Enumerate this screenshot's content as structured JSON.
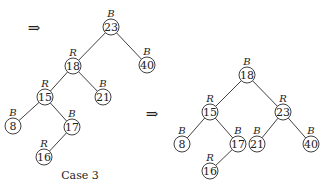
{
  "arrows": [
    {
      "symbol": "⇒",
      "x": 34,
      "y": 33
    },
    {
      "symbol": "⇒",
      "x": 152,
      "y": 119
    }
  ],
  "caption": {
    "text": "Case 3",
    "x": 80,
    "y": 179
  },
  "trees": [
    {
      "name": "before",
      "nodes": [
        {
          "id": "23",
          "value": "23",
          "color": "B",
          "x": 111,
          "y": 27
        },
        {
          "id": "18",
          "value": "18",
          "color": "R",
          "x": 73,
          "y": 66
        },
        {
          "id": "40",
          "value": "40",
          "color": "B",
          "x": 147,
          "y": 65
        },
        {
          "id": "15",
          "value": "15",
          "color": "R",
          "x": 45,
          "y": 97
        },
        {
          "id": "21",
          "value": "21",
          "color": "B",
          "x": 103,
          "y": 97
        },
        {
          "id": "8",
          "value": "8",
          "color": "B",
          "x": 13,
          "y": 126
        },
        {
          "id": "17",
          "value": "17",
          "color": "B",
          "x": 72,
          "y": 127
        },
        {
          "id": "16",
          "value": "16",
          "color": "R",
          "x": 44,
          "y": 157
        }
      ],
      "edges": [
        [
          "23",
          "18"
        ],
        [
          "23",
          "40"
        ],
        [
          "18",
          "15"
        ],
        [
          "18",
          "21"
        ],
        [
          "15",
          "8"
        ],
        [
          "15",
          "17"
        ],
        [
          "17",
          "16"
        ]
      ]
    },
    {
      "name": "after",
      "nodes": [
        {
          "id": "18",
          "value": "18",
          "color": "B",
          "x": 247,
          "y": 75
        },
        {
          "id": "15",
          "value": "15",
          "color": "R",
          "x": 210,
          "y": 112
        },
        {
          "id": "23",
          "value": "23",
          "color": "R",
          "x": 283,
          "y": 112
        },
        {
          "id": "8",
          "value": "8",
          "color": "B",
          "x": 182,
          "y": 144
        },
        {
          "id": "17",
          "value": "17",
          "color": "B",
          "x": 238,
          "y": 144
        },
        {
          "id": "21",
          "value": "21",
          "color": "B",
          "x": 257,
          "y": 144
        },
        {
          "id": "40",
          "value": "40",
          "color": "B",
          "x": 311,
          "y": 144
        },
        {
          "id": "16",
          "value": "16",
          "color": "R",
          "x": 210,
          "y": 171
        }
      ],
      "edges": [
        [
          "18",
          "15"
        ],
        [
          "18",
          "23"
        ],
        [
          "15",
          "8"
        ],
        [
          "15",
          "17"
        ],
        [
          "17",
          "16"
        ],
        [
          "23",
          "21"
        ],
        [
          "23",
          "40"
        ]
      ]
    }
  ],
  "node_radius": 8
}
